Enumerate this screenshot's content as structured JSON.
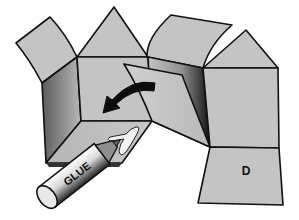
{
  "figure": {
    "title": "",
    "panel_label": "D",
    "glue_stick_label": "GLUE",
    "colors": {
      "panel_fill": "#c4c4c4",
      "outline": "#111111",
      "shadow_dark": "#2a2a2a",
      "glue_white": "#f2f2f2",
      "background": "#ffffff"
    },
    "elements": [
      {
        "id": "left-tab",
        "type": "flap"
      },
      {
        "id": "left-roof-triangle",
        "type": "triangle"
      },
      {
        "id": "center-front-face",
        "type": "face"
      },
      {
        "id": "left-side-face",
        "type": "face",
        "shaded": true
      },
      {
        "id": "bottom-glue-flap",
        "type": "flap",
        "has_glue": true
      },
      {
        "id": "top-middle-flap",
        "type": "flap"
      },
      {
        "id": "folding-flap",
        "type": "flap",
        "motion": "fold-left"
      },
      {
        "id": "middle-side-face",
        "type": "face",
        "shaded": true
      },
      {
        "id": "right-roof-triangle",
        "type": "triangle"
      },
      {
        "id": "right-front-face",
        "type": "face"
      },
      {
        "id": "panel-d",
        "type": "face",
        "label": "D"
      },
      {
        "id": "fold-arrow",
        "type": "arrow",
        "direction": "curved-left-down"
      },
      {
        "id": "glue-stick",
        "type": "tool",
        "label": "GLUE"
      }
    ]
  }
}
